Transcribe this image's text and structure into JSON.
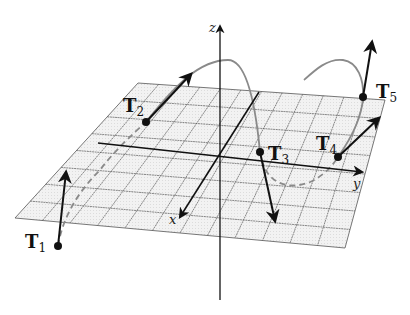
{
  "figure": {
    "colors": {
      "grid_fill": "#efefef",
      "grid_line": "#555555",
      "axis": "#111111",
      "curve": "#8a8a8a",
      "vector": "#111111",
      "point": "#111111"
    },
    "axes": {
      "x": {
        "label": "x"
      },
      "y": {
        "label": "y"
      },
      "z": {
        "label": "z"
      }
    },
    "tangent_vectors": [
      {
        "name": "T",
        "sub": "1"
      },
      {
        "name": "T",
        "sub": "2"
      },
      {
        "name": "T",
        "sub": "3"
      },
      {
        "name": "T",
        "sub": "4"
      },
      {
        "name": "T",
        "sub": "5"
      }
    ]
  }
}
